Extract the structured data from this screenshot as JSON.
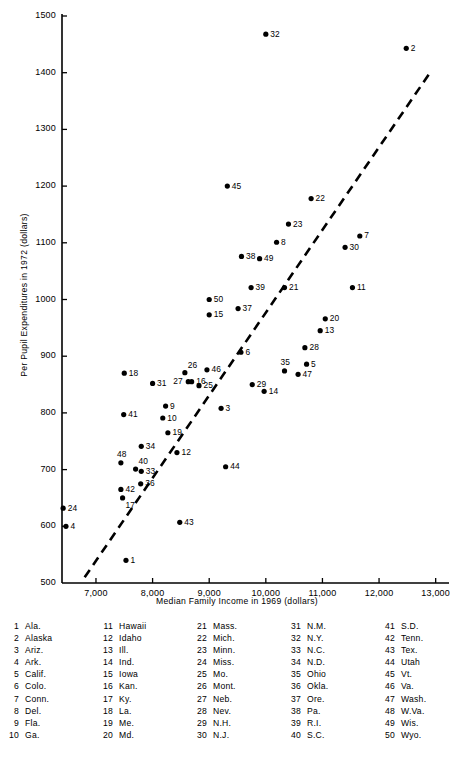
{
  "chart_data": {
    "type": "scatter",
    "title": "",
    "xlabel": "Median Family Income in 1969 (dollars)",
    "ylabel": "Per Pupil Expenditures in 1972 (dollars)",
    "xlim": [
      6400,
      13200
    ],
    "ylim": [
      500,
      1500
    ],
    "xticks": [
      "7,000",
      "8,000",
      "9,000",
      "10,000",
      "11,000",
      "12,000",
      "13,000"
    ],
    "xtickvalues": [
      7000,
      8000,
      9000,
      10000,
      11000,
      12000,
      13000
    ],
    "yticks": [
      "500",
      "600",
      "700",
      "800",
      "900",
      "1000",
      "1100",
      "1200",
      "1300",
      "1400",
      "1500"
    ],
    "ytickvalues": [
      500,
      600,
      700,
      800,
      900,
      1000,
      1100,
      1200,
      1300,
      1400,
      1500
    ],
    "grid": false,
    "legend_position": "below-plot-table",
    "trendline": {
      "style": "dashed",
      "x1": 6800,
      "y1": 510,
      "x2": 12900,
      "y2": 1400
    },
    "points": [
      {
        "id": 1,
        "x": 7530,
        "y": 540,
        "label": "1",
        "lpos": "right"
      },
      {
        "id": 2,
        "x": 12480,
        "y": 1443,
        "label": "2",
        "lpos": "right"
      },
      {
        "id": 3,
        "x": 9210,
        "y": 808,
        "label": "3",
        "lpos": "right"
      },
      {
        "id": 4,
        "x": 6470,
        "y": 600,
        "label": "4",
        "lpos": "right"
      },
      {
        "id": 5,
        "x": 10720,
        "y": 886,
        "label": "5",
        "lpos": "right"
      },
      {
        "id": 6,
        "x": 9560,
        "y": 907,
        "label": "6",
        "lpos": "right"
      },
      {
        "id": 7,
        "x": 11660,
        "y": 1112,
        "label": "7",
        "lpos": "right"
      },
      {
        "id": 8,
        "x": 10190,
        "y": 1101,
        "label": "8",
        "lpos": "right"
      },
      {
        "id": 9,
        "x": 8230,
        "y": 812,
        "label": "9",
        "lpos": "right"
      },
      {
        "id": 10,
        "x": 8180,
        "y": 791,
        "label": "10",
        "lpos": "right"
      },
      {
        "id": 11,
        "x": 11530,
        "y": 1021,
        "label": "11",
        "lpos": "right"
      },
      {
        "id": 12,
        "x": 8430,
        "y": 730,
        "label": "12",
        "lpos": "right"
      },
      {
        "id": 13,
        "x": 10960,
        "y": 945,
        "label": "13",
        "lpos": "right"
      },
      {
        "id": 14,
        "x": 9970,
        "y": 838,
        "label": "14",
        "lpos": "right"
      },
      {
        "id": 15,
        "x": 9000,
        "y": 973,
        "label": "15",
        "lpos": "right"
      },
      {
        "id": 16,
        "x": 8690,
        "y": 855,
        "label": "16",
        "lpos": "right"
      },
      {
        "id": 17,
        "x": 7470,
        "y": 650,
        "label": "17",
        "lpos": "below-right"
      },
      {
        "id": 18,
        "x": 7500,
        "y": 870,
        "label": "18",
        "lpos": "right"
      },
      {
        "id": 19,
        "x": 8270,
        "y": 765,
        "label": "19",
        "lpos": "right"
      },
      {
        "id": 20,
        "x": 11050,
        "y": 966,
        "label": "20",
        "lpos": "right"
      },
      {
        "id": 21,
        "x": 10330,
        "y": 1021,
        "label": "21",
        "lpos": "right"
      },
      {
        "id": 22,
        "x": 10800,
        "y": 1178,
        "label": "22",
        "lpos": "right"
      },
      {
        "id": 23,
        "x": 10400,
        "y": 1133,
        "label": "23",
        "lpos": "right"
      },
      {
        "id": 24,
        "x": 6420,
        "y": 632,
        "label": "24",
        "lpos": "right"
      },
      {
        "id": 25,
        "x": 8820,
        "y": 848,
        "label": "25",
        "lpos": "right"
      },
      {
        "id": 26,
        "x": 8570,
        "y": 871,
        "label": "26",
        "lpos": "above-right"
      },
      {
        "id": 27,
        "x": 8630,
        "y": 855,
        "label": "27",
        "lpos": "left"
      },
      {
        "id": 28,
        "x": 10690,
        "y": 915,
        "label": "28",
        "lpos": "right"
      },
      {
        "id": 29,
        "x": 9760,
        "y": 850,
        "label": "29",
        "lpos": "right"
      },
      {
        "id": 30,
        "x": 11400,
        "y": 1092,
        "label": "30",
        "lpos": "right"
      },
      {
        "id": 31,
        "x": 8000,
        "y": 852,
        "label": "31",
        "lpos": "right"
      },
      {
        "id": 32,
        "x": 10000,
        "y": 1468,
        "label": "32",
        "lpos": "right"
      },
      {
        "id": 33,
        "x": 7800,
        "y": 697,
        "label": "33",
        "lpos": "right"
      },
      {
        "id": 34,
        "x": 7800,
        "y": 741,
        "label": "34",
        "lpos": "right"
      },
      {
        "id": 35,
        "x": 10330,
        "y": 874,
        "label": "35",
        "lpos": "above"
      },
      {
        "id": 36,
        "x": 7790,
        "y": 675,
        "label": "36",
        "lpos": "right"
      },
      {
        "id": 37,
        "x": 9510,
        "y": 984,
        "label": "37",
        "lpos": "right"
      },
      {
        "id": 38,
        "x": 9570,
        "y": 1076,
        "label": "38",
        "lpos": "right"
      },
      {
        "id": 39,
        "x": 9740,
        "y": 1021,
        "label": "39",
        "lpos": "right"
      },
      {
        "id": 40,
        "x": 7700,
        "y": 701,
        "label": "40",
        "lpos": "above-right"
      },
      {
        "id": 41,
        "x": 7490,
        "y": 797,
        "label": "41",
        "lpos": "right"
      },
      {
        "id": 42,
        "x": 7440,
        "y": 665,
        "label": "42",
        "lpos": "right"
      },
      {
        "id": 43,
        "x": 8480,
        "y": 607,
        "label": "43",
        "lpos": "right"
      },
      {
        "id": 44,
        "x": 9290,
        "y": 705,
        "label": "44",
        "lpos": "right"
      },
      {
        "id": 45,
        "x": 9320,
        "y": 1200,
        "label": "45",
        "lpos": "right"
      },
      {
        "id": 46,
        "x": 8960,
        "y": 876,
        "label": "46",
        "lpos": "right"
      },
      {
        "id": 47,
        "x": 10570,
        "y": 868,
        "label": "47",
        "lpos": "right"
      },
      {
        "id": 48,
        "x": 7440,
        "y": 712,
        "label": "48",
        "lpos": "above"
      },
      {
        "id": 49,
        "x": 9890,
        "y": 1072,
        "label": "49",
        "lpos": "right"
      },
      {
        "id": 50,
        "x": 9000,
        "y": 1000,
        "label": "50",
        "lpos": "right"
      }
    ],
    "legend_columns": [
      [
        {
          "num": "1",
          "name": "Ala."
        },
        {
          "num": "2",
          "name": "Alaska"
        },
        {
          "num": "3",
          "name": "Ariz."
        },
        {
          "num": "4",
          "name": "Ark."
        },
        {
          "num": "5",
          "name": "Calif."
        },
        {
          "num": "6",
          "name": "Colo."
        },
        {
          "num": "7",
          "name": "Conn."
        },
        {
          "num": "8",
          "name": "Del."
        },
        {
          "num": "9",
          "name": "Fla."
        },
        {
          "num": "10",
          "name": "Ga."
        }
      ],
      [
        {
          "num": "11",
          "name": "Hawaii"
        },
        {
          "num": "12",
          "name": "Idaho"
        },
        {
          "num": "13",
          "name": "Ill."
        },
        {
          "num": "14",
          "name": "Ind."
        },
        {
          "num": "15",
          "name": "Iowa"
        },
        {
          "num": "16",
          "name": "Kan."
        },
        {
          "num": "17",
          "name": "Ky."
        },
        {
          "num": "18",
          "name": "La."
        },
        {
          "num": "19",
          "name": "Me."
        },
        {
          "num": "20",
          "name": "Md."
        }
      ],
      [
        {
          "num": "21",
          "name": "Mass."
        },
        {
          "num": "22",
          "name": "Mich."
        },
        {
          "num": "23",
          "name": "Minn."
        },
        {
          "num": "24",
          "name": "Miss."
        },
        {
          "num": "25",
          "name": "Mo."
        },
        {
          "num": "26",
          "name": "Mont."
        },
        {
          "num": "27",
          "name": "Neb."
        },
        {
          "num": "28",
          "name": "Nev."
        },
        {
          "num": "29",
          "name": "N.H."
        },
        {
          "num": "30",
          "name": "N.J."
        }
      ],
      [
        {
          "num": "31",
          "name": "N.M."
        },
        {
          "num": "32",
          "name": "N.Y."
        },
        {
          "num": "33",
          "name": "N.C."
        },
        {
          "num": "34",
          "name": "N.D."
        },
        {
          "num": "35",
          "name": "Ohio"
        },
        {
          "num": "36",
          "name": "Okla."
        },
        {
          "num": "37",
          "name": "Ore."
        },
        {
          "num": "38",
          "name": "Pa."
        },
        {
          "num": "39",
          "name": "R.I."
        },
        {
          "num": "40",
          "name": "S.C."
        }
      ],
      [
        {
          "num": "41",
          "name": "S.D."
        },
        {
          "num": "42",
          "name": "Tenn."
        },
        {
          "num": "43",
          "name": "Tex."
        },
        {
          "num": "44",
          "name": "Utah"
        },
        {
          "num": "45",
          "name": "Vt."
        },
        {
          "num": "46",
          "name": "Va."
        },
        {
          "num": "47",
          "name": "Wash."
        },
        {
          "num": "48",
          "name": "W.Va."
        },
        {
          "num": "49",
          "name": "Wis."
        },
        {
          "num": "50",
          "name": "Wyo."
        }
      ]
    ]
  },
  "colors": {
    "ink": "#000000",
    "background": "#ffffff"
  }
}
